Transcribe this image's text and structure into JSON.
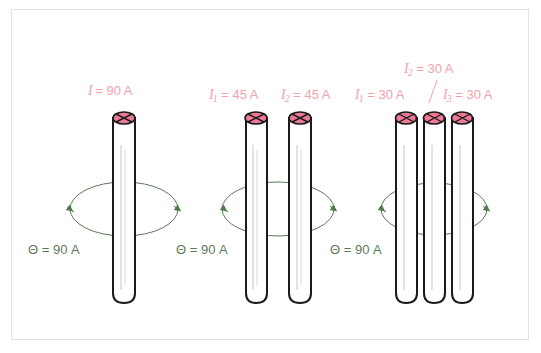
{
  "figure": {
    "border_color": "#e3e3e3",
    "background": "#ffffff"
  },
  "colors": {
    "current_label": "#f4a0a8",
    "loop": "#5c7a58",
    "theta_label": "#5c7a58",
    "wire_outline": "#1a1a1a",
    "wire_fill": "#ffffff",
    "cap_fill": "#f07a96",
    "cap_outline": "#1a1a1a",
    "highlight": "#b8b8b8"
  },
  "groups": [
    {
      "id": "group-single-wire",
      "wire_count": 1,
      "current_labels": [
        {
          "symbol": "I",
          "subscript": "",
          "value": "= 90 A",
          "text": "I = 90 A"
        }
      ],
      "enclosed_label": "Θ = 90 A",
      "loop_direction": "counterclockwise-into-page"
    },
    {
      "id": "group-two-wires",
      "wire_count": 2,
      "current_labels": [
        {
          "symbol": "I",
          "subscript": "1",
          "value": "= 45 A",
          "text": "I1 = 45 A"
        },
        {
          "symbol": "I",
          "subscript": "2",
          "value": "= 45 A",
          "text": "I2 = 45 A"
        }
      ],
      "enclosed_label": "Θ = 90 A",
      "loop_direction": "counterclockwise-into-page"
    },
    {
      "id": "group-three-wires",
      "wire_count": 3,
      "current_labels": [
        {
          "symbol": "I",
          "subscript": "1",
          "value": "= 30 A",
          "text": "I1 = 30 A"
        },
        {
          "symbol": "I",
          "subscript": "2",
          "value": "= 30 A",
          "text": "I2 = 30 A"
        },
        {
          "symbol": "I",
          "subscript": "3",
          "value": "= 30 A",
          "text": "I3 = 30 A"
        }
      ],
      "enclosed_label": "Θ = 90 A",
      "loop_direction": "counterclockwise-into-page"
    }
  ],
  "icons": {
    "wire_cap": "x-mark-into-page-icon",
    "loop_arrow": "arrowhead-icon"
  }
}
